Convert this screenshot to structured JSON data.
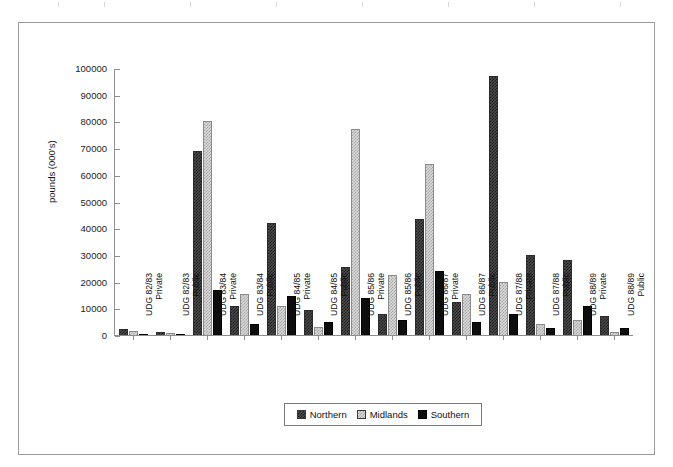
{
  "chart_data": {
    "type": "bar",
    "title": "",
    "xlabel": "",
    "ylabel": "pounds (000's)",
    "ylim": [
      0,
      100000
    ],
    "yticks": [
      0,
      10000,
      20000,
      30000,
      40000,
      50000,
      60000,
      70000,
      80000,
      90000,
      100000
    ],
    "grid": false,
    "legend_position": "bottom-center",
    "categories": [
      "UDG 82/83 Private",
      "UDG 82/83 Public",
      "UDG 83/84 Private",
      "UDG 83/84 Public",
      "UDG 84/85 Private",
      "UDG 84/85 Public",
      "UDG 85/86 Private",
      "UDG 85/86 Public",
      "UDG 86/87 Private",
      "UDG 86/87 Public",
      "UDG 87/88 Private",
      "UDG 87/88 Public",
      "UDG 88/89 Private",
      "UDG 88/89 Public"
    ],
    "category_lines": [
      [
        "UDG 82/83",
        "Private"
      ],
      [
        "UDG 82/83",
        "Public"
      ],
      [
        "UDG 83/84",
        "Private"
      ],
      [
        "UDG 83/84",
        "Public"
      ],
      [
        "UDG 84/85",
        "Private"
      ],
      [
        "UDG 84/85",
        "Public"
      ],
      [
        "UDG 85/86",
        "Private"
      ],
      [
        "UDG 85/86",
        "Public"
      ],
      [
        "UDG 86/87",
        "Private"
      ],
      [
        "UDG 86/87",
        "Public"
      ],
      [
        "UDG 87/88",
        "Private"
      ],
      [
        "UDG 87/88",
        "Public"
      ],
      [
        "UDG 88/89",
        "Private"
      ],
      [
        "UDG 88/89",
        "Public"
      ]
    ],
    "series": [
      {
        "name": "Northern",
        "color": "#4a4a4a",
        "values": [
          2200,
          1200,
          69000,
          11000,
          42000,
          9500,
          25500,
          8000,
          43500,
          12500,
          97000,
          30000,
          28000,
          7000
        ]
      },
      {
        "name": "Midlands",
        "color": "#d9d9d9",
        "values": [
          1500,
          700,
          80000,
          15500,
          11000,
          3000,
          77000,
          22500,
          64000,
          15500,
          20000,
          4000,
          5500,
          1000
        ]
      },
      {
        "name": "Southern",
        "color": "#0d0d0d",
        "values": [
          300,
          300,
          17000,
          4000,
          14500,
          5000,
          14000,
          5500,
          24000,
          5000,
          8000,
          2500,
          11000,
          2500
        ]
      }
    ]
  },
  "legend": {
    "items": [
      {
        "label": "Northern"
      },
      {
        "label": "Midlands"
      },
      {
        "label": "Southern"
      }
    ]
  }
}
